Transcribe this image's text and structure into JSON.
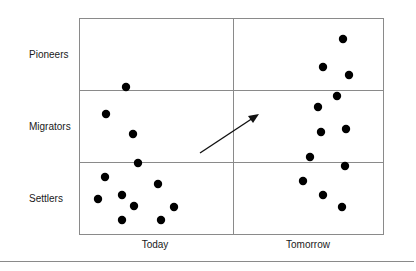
{
  "rows": [
    {
      "label": "Pioneers"
    },
    {
      "label": "Migrators"
    },
    {
      "label": "Settlers"
    }
  ],
  "columns": [
    {
      "label": "Today"
    },
    {
      "label": "Tomorrow"
    }
  ],
  "colors": {
    "grid": "#8a8a8a",
    "dot": "#000000",
    "arrow": "#111111",
    "text": "#1a1a1a"
  },
  "chart_data": {
    "type": "scatter",
    "title": "",
    "xlabel": "",
    "ylabel": "",
    "categories_x": [
      "Today",
      "Tomorrow"
    ],
    "categories_y": [
      "Pioneers",
      "Migrators",
      "Settlers"
    ],
    "series": [
      {
        "name": "Today",
        "points": [
          [
            126,
            87
          ],
          [
            106,
            114
          ],
          [
            133,
            134
          ],
          [
            138,
            163
          ],
          [
            105,
            177
          ],
          [
            158,
            184
          ],
          [
            98,
            199
          ],
          [
            122,
            195
          ],
          [
            134,
            206
          ],
          [
            174,
            207
          ],
          [
            122,
            220
          ],
          [
            161,
            220
          ]
        ]
      },
      {
        "name": "Tomorrow",
        "points": [
          [
            343,
            39
          ],
          [
            323,
            67
          ],
          [
            349,
            75
          ],
          [
            337,
            96
          ],
          [
            318,
            107
          ],
          [
            321,
            132
          ],
          [
            346,
            129
          ],
          [
            310,
            157
          ],
          [
            345,
            166
          ],
          [
            303,
            181
          ],
          [
            323,
            195
          ],
          [
            342,
            207
          ]
        ]
      }
    ],
    "counts": {
      "Today": {
        "Pioneers": 0,
        "Migrators": 3,
        "Settlers": 9
      },
      "Tomorrow": {
        "Pioneers": 3,
        "Migrators": 5,
        "Settlers": 4
      }
    },
    "annotations": [
      {
        "type": "arrow",
        "from": [
          200,
          153
        ],
        "to": [
          258,
          115
        ],
        "meaning": "shift from Today to Tomorrow"
      }
    ]
  }
}
